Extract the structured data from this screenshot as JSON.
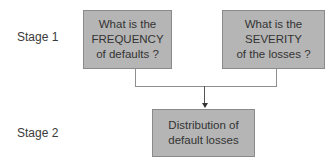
{
  "stages": [
    {
      "label": "Stage 1"
    },
    {
      "label": "Stage 2"
    }
  ],
  "boxes": {
    "frequency": {
      "lines": [
        "What is the",
        "FREQUENCY",
        "of defaults ?"
      ]
    },
    "severity": {
      "lines": [
        "What is the",
        "SEVERITY",
        "of the losses ?"
      ]
    },
    "distribution": {
      "lines": [
        "Distribution of",
        "default losses"
      ]
    }
  },
  "colors": {
    "box_fill": "#b5b5b5",
    "box_border": "#8a8a8a",
    "connector": "#8e8e8e",
    "text": "#333333"
  }
}
